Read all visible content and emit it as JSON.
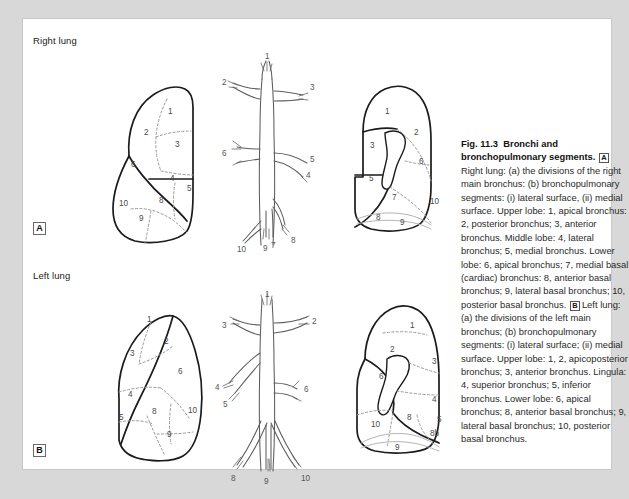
{
  "figure": {
    "number": "Fig. 11.3",
    "title": "Bronchi and bronchopulmonary segments.",
    "panel_a_tag": "A",
    "panel_b_tag": "B",
    "caption_a": "Right lung: (a) the divisions of the right main bronchus: (b) bronchopulmonary segments: (i) lateral surface, (ii) medial surface. Upper lobe: 1, apical bronchus: 2, posterior bronchus; 3, anterior bronchus. Middle lobe: 4, lateral bronchus; 5, medial bronchus.  Lower lobe: 6, apical bronchus; 7, medial basal (cardiac) bronchus: 8, anterior basal bronchus; 9, lateral basal bronchus; 10, posterior basal bronchus.",
    "caption_b": "Left lung: (a) the divisions of the left main bronchus; (b) bronchopulmonary segments: (i) lateral surface; (ii) medial surface. Upper lobe: 1, 2, apicoposterior bronchus; 3, anterior bronchus. Lingula: 4, superior bronchus; 5, inferior bronchus. Lower lobe: 6, apical bronchus; 8, anterior basal bronchus; 9, lateral basal bronchus; 10, posterior basal bronchus."
  },
  "labels": {
    "right_lung": "Right lung",
    "left_lung": "Left lung"
  },
  "colors": {
    "page_background": "#d8d8d8",
    "panel_background": "#ffffff",
    "outline_stroke": "#1b1b1b",
    "segment_dash": "#9a9a9a",
    "tree_stroke": "#5d5d5d",
    "text": "#2a2a2a"
  },
  "right_lateral": {
    "view": "lateral surface",
    "segments": [
      {
        "id": "1",
        "x": 145,
        "y": 93
      },
      {
        "id": "2",
        "x": 121,
        "y": 114
      },
      {
        "id": "3",
        "x": 152,
        "y": 126
      },
      {
        "id": "6",
        "x": 108,
        "y": 146
      },
      {
        "id": "4",
        "x": 147,
        "y": 160
      },
      {
        "id": "5",
        "x": 164,
        "y": 170
      },
      {
        "id": "10",
        "x": 99,
        "y": 185
      },
      {
        "id": "8",
        "x": 136,
        "y": 182
      },
      {
        "id": "9",
        "x": 116,
        "y": 200
      }
    ]
  },
  "right_tree": {
    "view": "divisions of the right main bronchus",
    "branches": [
      {
        "id": "1",
        "x": 259,
        "y": 42
      },
      {
        "id": "2",
        "x": 216,
        "y": 63
      },
      {
        "id": "3",
        "x": 289,
        "y": 68
      },
      {
        "id": "6",
        "x": 212,
        "y": 134
      },
      {
        "id": "5",
        "x": 290,
        "y": 140
      },
      {
        "id": "4",
        "x": 285,
        "y": 156
      },
      {
        "id": "7",
        "x": 264,
        "y": 211
      },
      {
        "id": "8",
        "x": 283,
        "y": 216
      },
      {
        "id": "9",
        "x": 256,
        "y": 225
      },
      {
        "id": "10",
        "x": 232,
        "y": 227
      }
    ]
  },
  "right_medial": {
    "view": "medial surface",
    "segments": [
      {
        "id": "1",
        "x": 364,
        "y": 92
      },
      {
        "id": "2",
        "x": 393,
        "y": 113
      },
      {
        "id": "3",
        "x": 349,
        "y": 126
      },
      {
        "id": "6",
        "x": 398,
        "y": 142
      },
      {
        "id": "5",
        "x": 348,
        "y": 159
      },
      {
        "id": "7",
        "x": 371,
        "y": 178
      },
      {
        "id": "10",
        "x": 409,
        "y": 182
      },
      {
        "id": "8",
        "x": 355,
        "y": 198
      },
      {
        "id": "9",
        "x": 379,
        "y": 203
      }
    ]
  },
  "left_lateral": {
    "view": "lateral surface",
    "segments": [
      {
        "id": "1",
        "x": 126,
        "y": 300
      },
      {
        "id": "2",
        "x": 143,
        "y": 322
      },
      {
        "id": "3",
        "x": 109,
        "y": 334
      },
      {
        "id": "6",
        "x": 157,
        "y": 352
      },
      {
        "id": "4",
        "x": 107,
        "y": 375
      },
      {
        "id": "5",
        "x": 98,
        "y": 398
      },
      {
        "id": "8",
        "x": 131,
        "y": 392
      },
      {
        "id": "10",
        "x": 167,
        "y": 391
      },
      {
        "id": "9",
        "x": 146,
        "y": 415
      }
    ]
  },
  "left_tree": {
    "view": "divisions of the left main bronchus",
    "branches": [
      {
        "id": "1",
        "x": 251,
        "y": 283
      },
      {
        "id": "3",
        "x": 214,
        "y": 313
      },
      {
        "id": "2",
        "x": 292,
        "y": 310
      },
      {
        "id": "4",
        "x": 203,
        "y": 367
      },
      {
        "id": "5",
        "x": 212,
        "y": 383
      },
      {
        "id": "6",
        "x": 285,
        "y": 369
      },
      {
        "id": "8",
        "x": 230,
        "y": 449
      },
      {
        "id": "9",
        "x": 255,
        "y": 453
      },
      {
        "id": "10",
        "x": 283,
        "y": 449
      }
    ]
  },
  "left_medial": {
    "view": "medial surface",
    "segments": [
      {
        "id": "1",
        "x": 390,
        "y": 306
      },
      {
        "id": "2",
        "x": 370,
        "y": 330
      },
      {
        "id": "3",
        "x": 412,
        "y": 342
      },
      {
        "id": "6",
        "x": 359,
        "y": 357
      },
      {
        "id": "4",
        "x": 412,
        "y": 380
      },
      {
        "id": "10",
        "x": 351,
        "y": 405
      },
      {
        "id": "8",
        "x": 387,
        "y": 398
      },
      {
        "id": "5",
        "x": 417,
        "y": 400
      },
      {
        "id": "8b",
        "x": 410,
        "y": 414
      },
      {
        "id": "9",
        "x": 375,
        "y": 428
      }
    ]
  }
}
